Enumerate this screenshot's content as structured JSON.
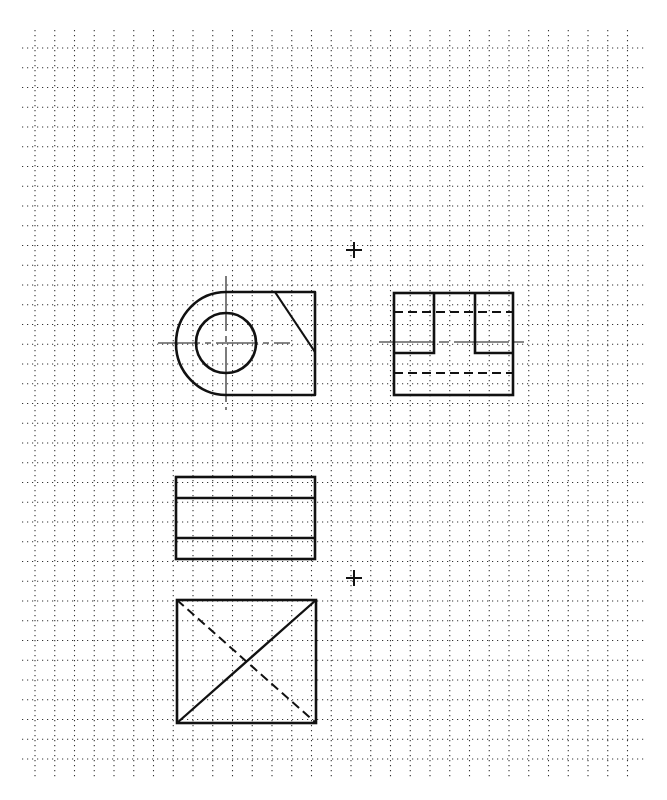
{
  "grid": {
    "x0": 35,
    "y0": 48,
    "spacing": 19.75,
    "cols": 31,
    "rows": 37,
    "line_left": 22,
    "line_right": 646,
    "line_top": 30,
    "line_bottom": 780,
    "color": "#333333"
  },
  "ink_color": "#111111",
  "registration_marks": [
    {
      "name": "mark-top",
      "x": 354,
      "y": 250
    },
    {
      "name": "mark-middle",
      "x": 354,
      "y": 578
    }
  ],
  "views": {
    "front": {
      "label": "Front view",
      "left_arc_center": [
        226,
        343
      ],
      "outer_radius": 50,
      "top": 292,
      "bottom": 395,
      "right": 315,
      "hole": {
        "cx": 226,
        "cy": 343,
        "r": 30
      },
      "chamfer": [
        [
          275,
          292
        ],
        [
          315,
          352
        ]
      ],
      "centerline_h": [
        158,
        290,
        343
      ],
      "centerline_v": [
        226,
        276,
        410
      ]
    },
    "side": {
      "label": "Side view",
      "rect": [
        394,
        293,
        513,
        395
      ],
      "slot_left_x": 434,
      "slot_right_x": 475,
      "slot_bottom_y": 353,
      "hidden_lines_y": [
        312,
        373
      ],
      "centerline": [
        379,
        528,
        342
      ]
    },
    "top": {
      "label": "Top view",
      "rect": [
        176,
        477,
        315,
        559
      ],
      "lines_y": [
        498,
        538
      ]
    },
    "auxiliary": {
      "label": "Auxiliary view",
      "rect": [
        177,
        600,
        316,
        723
      ],
      "solid_diagonal": "bottom-left to top-right",
      "hidden_diagonal": "top-left to bottom-right"
    }
  }
}
